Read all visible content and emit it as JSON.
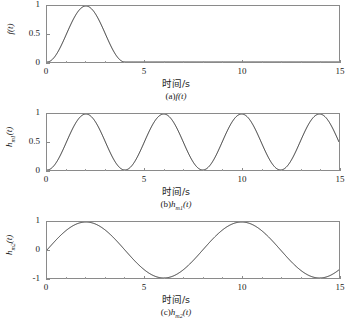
{
  "figure": {
    "background": "#ffffff",
    "line_color": "#2b2b2b",
    "axis_color": "#8a8a8a",
    "xaxis_title": "时间/s"
  },
  "panels": [
    {
      "id": "a",
      "caption_prefix": "(a)",
      "caption_symbol": "f",
      "caption_sub": "",
      "caption_arg": "(t)",
      "ylabel_symbol": "f",
      "ylabel_sub": "",
      "ylabel_arg": "(t)",
      "yticks": [
        "1",
        "0.5",
        "0"
      ],
      "ytick_values": [
        1,
        0.5,
        0
      ],
      "xticks": [
        "0",
        "5",
        "10",
        "15"
      ],
      "xtick_values": [
        0,
        5,
        10,
        15
      ]
    },
    {
      "id": "b",
      "caption_prefix": "(b)",
      "caption_symbol": "h",
      "caption_sub": "m1",
      "caption_arg": "(t)",
      "ylabel_symbol": "h",
      "ylabel_sub": "m1",
      "ylabel_arg": "(t)",
      "yticks": [
        "1",
        "0.5",
        "0"
      ],
      "ytick_values": [
        1,
        0.5,
        0
      ],
      "xticks": [
        "0",
        "5",
        "10",
        "15"
      ],
      "xtick_values": [
        0,
        5,
        10,
        15
      ]
    },
    {
      "id": "c",
      "caption_prefix": "(c)",
      "caption_symbol": "h",
      "caption_sub": "m2",
      "caption_arg": "(t)",
      "ylabel_symbol": "h",
      "ylabel_sub": "m2",
      "ylabel_arg": "(t)",
      "yticks": [
        "1",
        "0",
        "-1"
      ],
      "ytick_values": [
        1,
        0,
        -1
      ],
      "xticks": [
        "0",
        "5",
        "10",
        "15"
      ],
      "xtick_values": [
        0,
        5,
        10,
        15
      ]
    }
  ],
  "chart_data": [
    {
      "type": "line",
      "title": "(a)f(t)",
      "xlabel": "时间/s",
      "ylabel": "f(t)",
      "xlim": [
        0,
        15
      ],
      "ylim": [
        0,
        1
      ],
      "xticks": [
        0,
        5,
        10,
        15
      ],
      "yticks": [
        0,
        0.5,
        1
      ],
      "grid": false,
      "legend": null,
      "description": "Raised-cosine (Hanning) pulse of duration 4 s: f(t)=0.5*(1-cos(pi*t/2)) for 0<=t<=4, and 0 for t>4. Peak value 1 at t=2 s.",
      "formula": "0.5*(1-cos(pi*t/2)) for 0<=t<=4 else 0",
      "x": [
        0,
        0.5,
        1,
        1.5,
        2,
        2.5,
        3,
        3.5,
        4,
        5,
        6,
        7,
        8,
        9,
        10,
        11,
        12,
        13,
        14,
        15
      ],
      "y": [
        0,
        0.146,
        0.5,
        0.854,
        1,
        0.854,
        0.5,
        0.146,
        0,
        0,
        0,
        0,
        0,
        0,
        0,
        0,
        0,
        0,
        0,
        0
      ]
    },
    {
      "type": "line",
      "title": "(b)h_m1(t)",
      "xlabel": "时间/s",
      "ylabel": "h_m1(t)",
      "xlim": [
        0,
        15
      ],
      "ylim": [
        0,
        1
      ],
      "xticks": [
        0,
        5,
        10,
        15
      ],
      "yticks": [
        0,
        0.5,
        1
      ],
      "grid": false,
      "legend": null,
      "description": "Continuous raised cosine, period 4 s, range 0 to 1: h(t)=0.5*(1-cos(pi*t/2)). Maxima of 1 at t=2,6,10,14 s; minima of 0 at t=0,4,8,12 s.",
      "formula": "0.5*(1-cos(pi*t/2))",
      "x": [
        0,
        1,
        2,
        3,
        4,
        5,
        6,
        7,
        8,
        9,
        10,
        11,
        12,
        13,
        14,
        15
      ],
      "y": [
        0,
        0.5,
        1,
        0.5,
        0,
        0.5,
        1,
        0.5,
        0,
        0.5,
        1,
        0.5,
        0,
        0.5,
        1,
        0.5
      ]
    },
    {
      "type": "line",
      "title": "(c)h_m2(t)",
      "xlabel": "时间/s",
      "ylabel": "h_m2(t)",
      "xlim": [
        0,
        15
      ],
      "ylim": [
        -1,
        1
      ],
      "xticks": [
        0,
        5,
        10,
        15
      ],
      "yticks": [
        -1,
        0,
        1
      ],
      "grid": false,
      "legend": null,
      "description": "Sine wave, period 8 s, range -1 to 1: h(t)=sin(pi*t/4). Maxima of 1 at t=2,10 s; minima of -1 at t=6,14 s; zero crossings at t=0,4,8,12 s.",
      "formula": "sin(pi*t/4)",
      "x": [
        0,
        1,
        2,
        3,
        4,
        5,
        6,
        7,
        8,
        9,
        10,
        11,
        12,
        13,
        14,
        15
      ],
      "y": [
        0,
        0.707,
        1,
        0.707,
        0,
        -0.707,
        -1,
        -0.707,
        0,
        0.707,
        1,
        0.707,
        0,
        -0.707,
        -1,
        -0.707
      ]
    }
  ]
}
